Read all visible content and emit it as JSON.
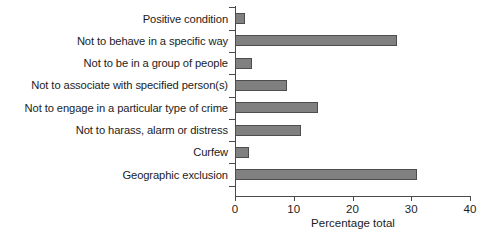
{
  "chart_data": {
    "type": "bar",
    "orientation": "horizontal",
    "title": "",
    "xlabel": "Percentage total",
    "ylabel": "",
    "xlim": [
      0,
      40
    ],
    "xticks": [
      0,
      10,
      20,
      30,
      40
    ],
    "xtick_labels": [
      "0",
      "10",
      "20",
      "30",
      "40"
    ],
    "grid": false,
    "legend": null,
    "bar_color": "#808080",
    "bar_edge_color": "#4d4d4d",
    "axis_color": "#4a4a4a",
    "categories": [
      "Positive condition",
      "Not to behave in a specific way",
      "Not to be in a group of people",
      "Not to associate with specified person(s)",
      "Not to engage in a particular type of crime",
      "Not to harass, alarm or distress",
      "Curfew",
      "Geographic exclusion"
    ],
    "values": [
      1.7,
      27.6,
      2.9,
      8.9,
      14.1,
      11.2,
      2.4,
      31.0
    ]
  }
}
